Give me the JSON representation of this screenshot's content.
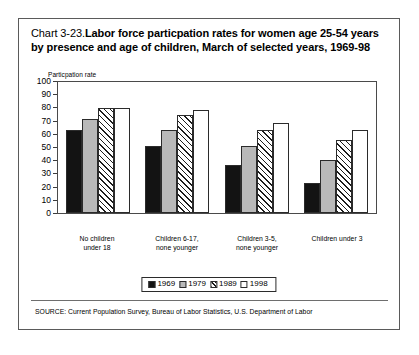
{
  "figure": {
    "title_number": "Chart 3-23.",
    "title_text": "Labor force particpation rates for women age 25-54 years by presence and age of children, March of selected years, 1969-98",
    "y_axis_title": "Particpation rate",
    "source_note": "SOURCE: Current Population Survey, Bureau of Labor Statistics, U.S. Department of Labor"
  },
  "legend": {
    "entries": [
      {
        "label": "1969",
        "swatch": "black-solid"
      },
      {
        "label": "1979",
        "swatch": "gray-solid"
      },
      {
        "label": "1989",
        "swatch": "diagonal-hatch"
      },
      {
        "label": "1998",
        "swatch": "white-empty"
      }
    ]
  },
  "axis": {
    "y_ticks": [
      "100",
      "90",
      "80",
      "70",
      "60",
      "50",
      "40",
      "30",
      "20",
      "10",
      "0"
    ]
  },
  "chart_data": {
    "type": "bar",
    "xlabel": "",
    "ylabel": "Particpation rate",
    "ylim": [
      0,
      100
    ],
    "ytick_interval": 10,
    "grid": false,
    "legend_position": "bottom-center",
    "categories": [
      "No children under 18",
      "Children 6-17, none younger",
      "Children 3-5, none younger",
      "Children under 3"
    ],
    "categories_lines": [
      [
        "No children",
        "under 18"
      ],
      [
        "Children 6-17,",
        "none younger"
      ],
      [
        "Children 3-5,",
        "none younger"
      ],
      [
        "Children under 3"
      ]
    ],
    "series": [
      {
        "name": "1969",
        "fill": "black-solid",
        "values": [
          63.0,
          51.5,
          36.5,
          23.0
        ]
      },
      {
        "name": "1979",
        "fill": "gray-solid",
        "values": [
          72.0,
          63.0,
          51.0,
          40.5
        ]
      },
      {
        "name": "1989",
        "fill": "diagonal-hatch",
        "values": [
          80.0,
          74.5,
          63.5,
          56.0
        ]
      },
      {
        "name": "1998",
        "fill": "white-empty",
        "values": [
          80.5,
          78.5,
          68.5,
          63.5
        ]
      }
    ],
    "source": "SOURCE: Current Population Survey, Bureau of Labor Statistics, U.S. Department of Labor"
  },
  "colors": {
    "series_1969": "#131313",
    "series_1979": "#b9b9b9",
    "series_1989_hatch": "#1c1c1c",
    "series_1998": "#ffffff",
    "frame": "#5a5a5a",
    "axis": "#4a4a4a"
  }
}
